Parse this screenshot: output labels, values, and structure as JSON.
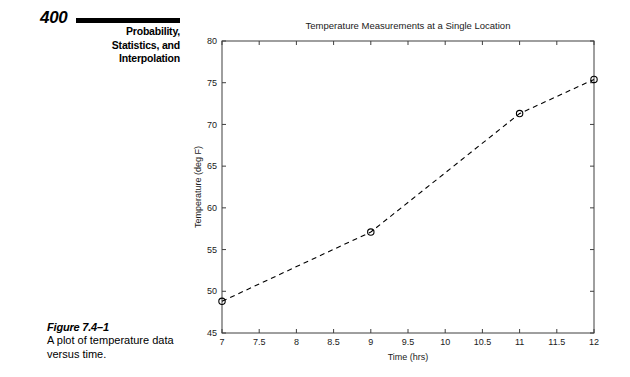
{
  "page": {
    "number": "400",
    "chapter_title": "Probability,\nStatistics, and\nInterpolation",
    "chapter_title_lines": [
      "Probability,",
      "Statistics, and",
      "Interpolation"
    ]
  },
  "caption": {
    "label": "Figure 7.4–1",
    "text": "A plot of temperature data versus time."
  },
  "chart_data": {
    "type": "line",
    "title": "Temperature Measurements at a Single Location",
    "xlabel": "Time (hrs)",
    "ylabel": "Temperature (deg F)",
    "xlim": [
      7,
      12
    ],
    "ylim": [
      45,
      80
    ],
    "grid": false,
    "legend": null,
    "line_style": "dashed",
    "marker": "circle",
    "x_ticks": [
      7,
      7.5,
      8,
      8.5,
      9,
      9.5,
      10,
      10.5,
      11,
      11.5,
      12
    ],
    "x_tick_labels": [
      "7",
      "7.5",
      "8",
      "8.5",
      "9",
      "9.5",
      "10",
      "10.5",
      "11",
      "11.5",
      "12"
    ],
    "y_ticks": [
      45,
      50,
      55,
      60,
      65,
      70,
      75,
      80
    ],
    "y_tick_labels": [
      "45",
      "50",
      "55",
      "60",
      "65",
      "70",
      "75",
      "80"
    ],
    "x": [
      7,
      9,
      11,
      12
    ],
    "values": [
      48.8,
      57.1,
      71.3,
      75.4
    ],
    "points": [
      {
        "x": 7,
        "y": 48.8
      },
      {
        "x": 9,
        "y": 57.1
      },
      {
        "x": 11,
        "y": 71.3
      },
      {
        "x": 12,
        "y": 75.4
      }
    ]
  }
}
